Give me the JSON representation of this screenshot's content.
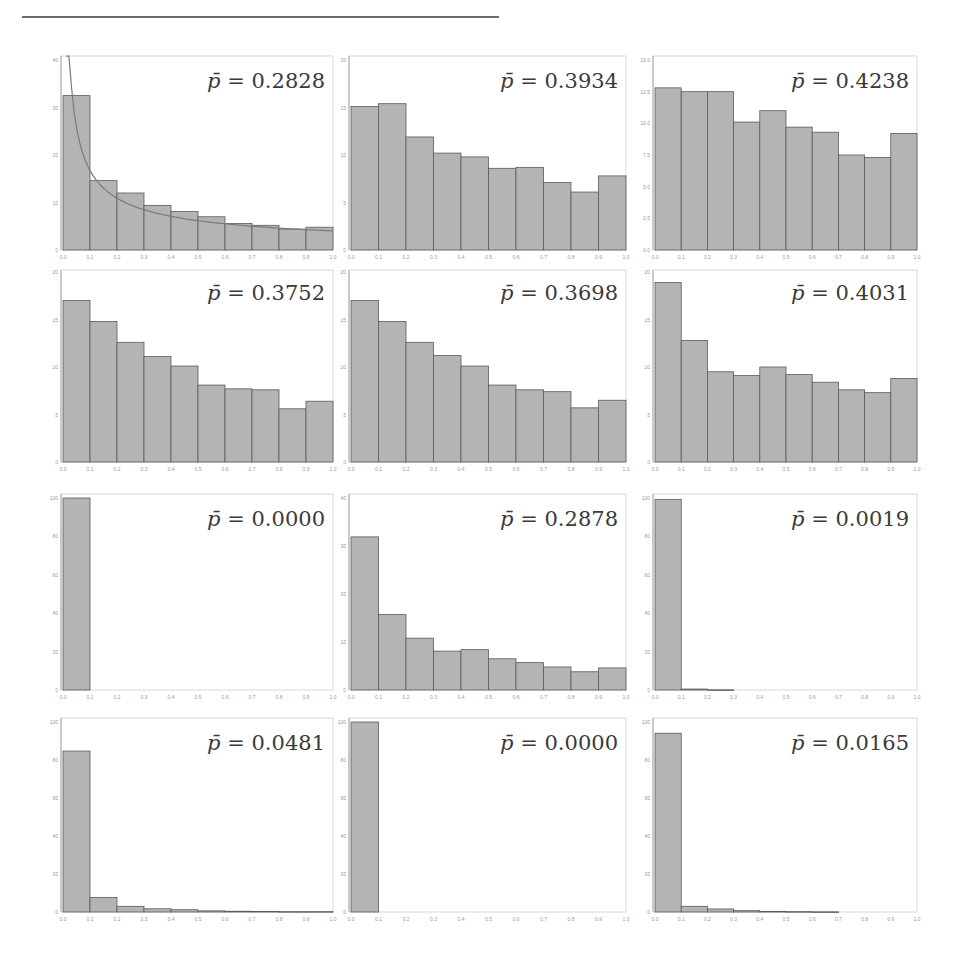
{
  "header": {
    "text": ""
  },
  "chart_data": [
    {
      "type": "bar",
      "title": "",
      "annotation": "p̄ = 0.2828",
      "p_bar": "0.2828",
      "categories": [
        "0.0-0.1",
        "0.1-0.2",
        "0.2-0.3",
        "0.3-0.4",
        "0.4-0.5",
        "0.5-0.6",
        "0.6-0.7",
        "0.7-0.8",
        "0.8-0.9",
        "0.9-1.0"
      ],
      "values": [
        32.5,
        14.6,
        12.0,
        9.4,
        8.1,
        7.0,
        5.6,
        5.2,
        4.4,
        4.8
      ],
      "ylim": [
        0,
        40
      ],
      "yticks": [
        "0",
        "10",
        "20",
        "30",
        "40"
      ],
      "xticks": [
        "0.0",
        "0.1",
        "0.2",
        "0.3",
        "0.4",
        "0.5",
        "0.6",
        "0.7",
        "0.8",
        "0.9",
        "1.0"
      ],
      "fit_curve": true
    },
    {
      "type": "bar",
      "annotation": "p̄ = 0.3934",
      "p_bar": "0.3934",
      "values": [
        15.1,
        15.4,
        11.9,
        10.2,
        9.8,
        8.6,
        8.7,
        7.1,
        6.1,
        7.8
      ],
      "ylim": [
        0,
        20
      ],
      "yticks": [
        "0",
        "5",
        "10",
        "15",
        "20"
      ],
      "xticks": [
        "0.0",
        "0.1",
        "0.2",
        "0.3",
        "0.4",
        "0.5",
        "0.6",
        "0.7",
        "0.8",
        "0.9",
        "1.0"
      ]
    },
    {
      "type": "bar",
      "annotation": "p̄ = 0.4238",
      "p_bar": "0.4238",
      "values": [
        12.8,
        12.5,
        12.5,
        10.1,
        11.0,
        9.7,
        9.3,
        7.5,
        7.3,
        9.2
      ],
      "ylim": [
        0,
        15
      ],
      "yticks": [
        "0.0",
        "2.5",
        "5.0",
        "7.5",
        "10.0",
        "12.5",
        "15.0"
      ],
      "xticks": [
        "0.0",
        "0.1",
        "0.2",
        "0.3",
        "0.4",
        "0.5",
        "0.6",
        "0.7",
        "0.8",
        "0.9",
        "1.0"
      ]
    },
    {
      "type": "bar",
      "annotation": "p̄ = 0.3752",
      "p_bar": "0.3752",
      "values": [
        17.0,
        14.8,
        12.6,
        11.1,
        10.1,
        8.1,
        7.7,
        7.6,
        5.6,
        6.4
      ],
      "ylim": [
        0,
        20
      ],
      "yticks": [
        "0",
        "5",
        "10",
        "15",
        "20"
      ],
      "xticks": [
        "0.0",
        "0.1",
        "0.2",
        "0.3",
        "0.4",
        "0.5",
        "0.6",
        "0.7",
        "0.8",
        "0.9",
        "1.0"
      ]
    },
    {
      "type": "bar",
      "annotation": "p̄ = 0.3698",
      "p_bar": "0.3698",
      "values": [
        17.0,
        14.8,
        12.6,
        11.2,
        10.1,
        8.1,
        7.6,
        7.4,
        5.7,
        6.5
      ],
      "ylim": [
        0,
        20
      ],
      "yticks": [
        "0",
        "5",
        "10",
        "15",
        "20"
      ],
      "xticks": [
        "0.0",
        "0.1",
        "0.2",
        "0.3",
        "0.4",
        "0.5",
        "0.6",
        "0.7",
        "0.8",
        "0.9",
        "1.0"
      ]
    },
    {
      "type": "bar",
      "annotation": "p̄ = 0.4031",
      "p_bar": "0.4031",
      "values": [
        18.9,
        12.8,
        9.5,
        9.1,
        10.0,
        9.2,
        8.4,
        7.6,
        7.3,
        8.8
      ],
      "ylim": [
        0,
        20
      ],
      "yticks": [
        "0",
        "5",
        "10",
        "15",
        "20"
      ],
      "xticks": [
        "0.0",
        "0.1",
        "0.2",
        "0.3",
        "0.4",
        "0.5",
        "0.6",
        "0.7",
        "0.8",
        "0.9",
        "1.0"
      ]
    },
    {
      "type": "bar",
      "annotation": "p̄ = 0.0000",
      "p_bar": "0.0000",
      "values": [
        100,
        0,
        0,
        0,
        0,
        0,
        0,
        0,
        0,
        0
      ],
      "ylim": [
        0,
        100
      ],
      "yticks": [
        "0",
        "20",
        "40",
        "60",
        "80",
        "100"
      ],
      "xticks": [
        "0.0",
        "0.1",
        "0.2",
        "0.3",
        "0.4",
        "0.5",
        "0.6",
        "0.7",
        "0.8",
        "0.9",
        "1.0"
      ]
    },
    {
      "type": "bar",
      "annotation": "p̄ = 0.2878",
      "p_bar": "0.2878",
      "values": [
        31.9,
        15.7,
        10.8,
        8.1,
        8.4,
        6.5,
        5.7,
        4.8,
        3.8,
        4.6
      ],
      "ylim": [
        0,
        40
      ],
      "yticks": [
        "0",
        "10",
        "20",
        "30",
        "40"
      ],
      "xticks": [
        "0.0",
        "0.1",
        "0.2",
        "0.3",
        "0.4",
        "0.5",
        "0.6",
        "0.7",
        "0.8",
        "0.9",
        "1.0"
      ]
    },
    {
      "type": "bar",
      "annotation": "p̄ = 0.0019",
      "p_bar": "0.0019",
      "values": [
        99.3,
        0.5,
        0.1,
        0,
        0,
        0,
        0,
        0,
        0,
        0
      ],
      "ylim": [
        0,
        100
      ],
      "yticks": [
        "0",
        "20",
        "40",
        "60",
        "80",
        "100"
      ],
      "xticks": [
        "0.0",
        "0.1",
        "0.2",
        "0.3",
        "0.4",
        "0.5",
        "0.6",
        "0.7",
        "0.8",
        "0.9",
        "1.0"
      ]
    },
    {
      "type": "bar",
      "annotation": "p̄ = 0.0481",
      "p_bar": "0.0481",
      "values": [
        84.7,
        7.7,
        3.0,
        1.7,
        1.2,
        0.6,
        0.4,
        0.3,
        0.2,
        0.2
      ],
      "ylim": [
        0,
        100
      ],
      "yticks": [
        "0",
        "20",
        "40",
        "60",
        "80",
        "100"
      ],
      "xticks": [
        "0.0",
        "0.1",
        "0.2",
        "0.3",
        "0.4",
        "0.5",
        "0.6",
        "0.7",
        "0.8",
        "0.9",
        "1.0"
      ]
    },
    {
      "type": "bar",
      "annotation": "p̄ = 0.0000",
      "p_bar": "0.0000",
      "values": [
        100,
        0,
        0,
        0,
        0,
        0,
        0,
        0,
        0,
        0
      ],
      "ylim": [
        0,
        100
      ],
      "yticks": [
        "0",
        "20",
        "40",
        "60",
        "80",
        "100"
      ],
      "xticks": [
        "0.0",
        "0.1",
        "0.2",
        "0.3",
        "0.4",
        "0.5",
        "0.6",
        "0.7",
        "0.8",
        "0.9",
        "1.0"
      ]
    },
    {
      "type": "bar",
      "annotation": "p̄ = 0.0165",
      "p_bar": "0.0165",
      "values": [
        94.1,
        3.0,
        1.6,
        0.7,
        0.3,
        0.2,
        0.1,
        0.0,
        0.0,
        0.0
      ],
      "ylim": [
        0,
        100
      ],
      "yticks": [
        "0",
        "20",
        "40",
        "60",
        "80",
        "100"
      ],
      "xticks": [
        "0.0",
        "0.1",
        "0.2",
        "0.3",
        "0.4",
        "0.5",
        "0.6",
        "0.7",
        "0.8",
        "0.9",
        "1.0"
      ]
    }
  ],
  "layout": {
    "bar_color": "#b4b4b4",
    "bar_edge": "#5a5a5a",
    "frame_color": "#d8d8d8",
    "curve_color": "#7a7a7a"
  }
}
